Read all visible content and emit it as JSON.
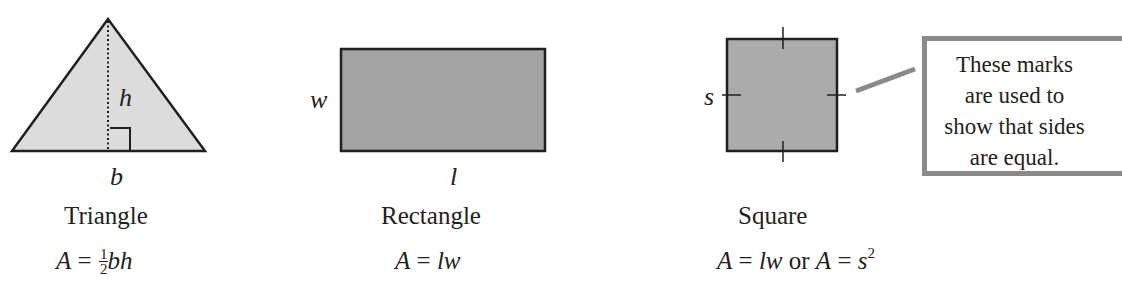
{
  "figure": {
    "shapes": [
      {
        "id": "triangle",
        "name": "Triangle",
        "formula": {
          "lhs": "A",
          "eq": "=",
          "frac_num": "1",
          "frac_den": "2",
          "rhs_vars": "bh"
        },
        "labels": {
          "base": "b",
          "height": "h"
        },
        "fill": "#dcdcdc"
      },
      {
        "id": "rectangle",
        "name": "Rectangle",
        "formula": {
          "lhs": "A",
          "eq": "=",
          "rhs": "lw"
        },
        "labels": {
          "length": "l",
          "width": "w"
        },
        "fill": "#a3a3a3"
      },
      {
        "id": "square",
        "name": "Square",
        "formula": {
          "lhs": "A",
          "eq": "=",
          "rhs": "lw",
          "or": "or",
          "lhs2": "A",
          "eq2": "=",
          "rhs2": "s",
          "exp2": "2"
        },
        "labels": {
          "side": "s"
        },
        "fill": "#ababab"
      }
    ],
    "callout": {
      "lines": [
        "These marks",
        "are used to",
        "show that sides",
        "are equal."
      ],
      "border_color": "#8a8a8a"
    },
    "stroke_color": "#231f20"
  }
}
